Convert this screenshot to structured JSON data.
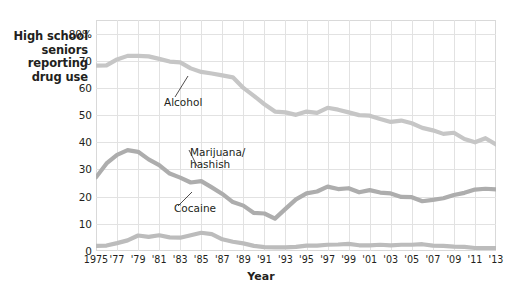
{
  "axis": {
    "y_title_lines": [
      "High school",
      "seniors",
      "reporting",
      "drug use"
    ],
    "y_ticks": [
      "0",
      "10",
      "20",
      "30",
      "40",
      "50",
      "60",
      "70",
      "80%"
    ],
    "x_title": "Year",
    "x_ticks": [
      "1975",
      "'77",
      "'79",
      "'81",
      "'83",
      "'85",
      "'87",
      "'89",
      "'91",
      "'93",
      "'95",
      "'97",
      "'99",
      "'01",
      "'03",
      "'05",
      "'07",
      "'09",
      "'11",
      "'13"
    ]
  },
  "labels": {
    "alcohol": "Alcohol",
    "marijuana_line1": "Marijuana/",
    "marijuana_line2": "hashish",
    "cocaine": "Cocaine"
  },
  "colors": {
    "alcohol_line": "#c6c6c6",
    "marijuana_line": "#adadad",
    "cocaine_line": "#bcbcbc",
    "grid": "#e2e2e2",
    "border": "#d9d9d9",
    "text": "#231f20"
  },
  "chart_data": {
    "type": "line",
    "title": "",
    "xlabel": "Year",
    "ylabel": "High school seniors reporting drug use",
    "xlim": [
      1975,
      2013
    ],
    "ylim": [
      0,
      85
    ],
    "ytick_values": [
      0,
      10,
      20,
      30,
      40,
      50,
      60,
      70,
      80
    ],
    "grid": true,
    "legend": "inline-annotations",
    "x": [
      1975,
      1976,
      1977,
      1978,
      1979,
      1980,
      1981,
      1982,
      1983,
      1984,
      1985,
      1986,
      1987,
      1988,
      1989,
      1990,
      1991,
      1992,
      1993,
      1994,
      1995,
      1996,
      1997,
      1998,
      1999,
      2000,
      2001,
      2002,
      2003,
      2004,
      2005,
      2006,
      2007,
      2008,
      2009,
      2010,
      2011,
      2012,
      2013
    ],
    "series": [
      {
        "name": "Alcohol",
        "color": "#c6c6c6",
        "values": [
          68.2,
          68.3,
          70.5,
          71.8,
          71.8,
          71.6,
          70.7,
          69.7,
          69.4,
          67.2,
          65.9,
          65.3,
          64.6,
          63.9,
          60.0,
          57.1,
          54.0,
          51.3,
          51.0,
          50.1,
          51.3,
          50.8,
          52.7,
          52.0,
          51.0,
          50.0,
          49.8,
          48.6,
          47.5,
          48.0,
          47.0,
          45.3,
          44.4,
          43.1,
          43.5,
          41.2,
          40.0,
          41.5,
          39.2
        ]
      },
      {
        "name": "Marijuana/hashish",
        "color": "#adadad",
        "values": [
          27.1,
          32.2,
          35.4,
          37.1,
          36.5,
          33.7,
          31.6,
          28.5,
          27.0,
          25.2,
          25.7,
          23.4,
          21.0,
          18.0,
          16.7,
          14.0,
          13.8,
          11.9,
          15.5,
          19.0,
          21.2,
          21.9,
          23.7,
          22.8,
          23.1,
          21.6,
          22.4,
          21.5,
          21.2,
          19.9,
          19.8,
          18.3,
          18.8,
          19.4,
          20.6,
          21.4,
          22.6,
          22.9,
          22.7
        ]
      },
      {
        "name": "Cocaine",
        "color": "#bcbcbc",
        "values": [
          1.9,
          2.0,
          2.9,
          3.9,
          5.7,
          5.2,
          5.8,
          5.0,
          4.9,
          5.8,
          6.7,
          6.2,
          4.3,
          3.4,
          2.8,
          1.9,
          1.4,
          1.3,
          1.3,
          1.5,
          2.0,
          2.0,
          2.3,
          2.4,
          2.6,
          2.1,
          2.1,
          2.3,
          2.1,
          2.3,
          2.3,
          2.5,
          2.0,
          1.9,
          1.6,
          1.5,
          1.1,
          1.1,
          1.1
        ]
      }
    ]
  }
}
